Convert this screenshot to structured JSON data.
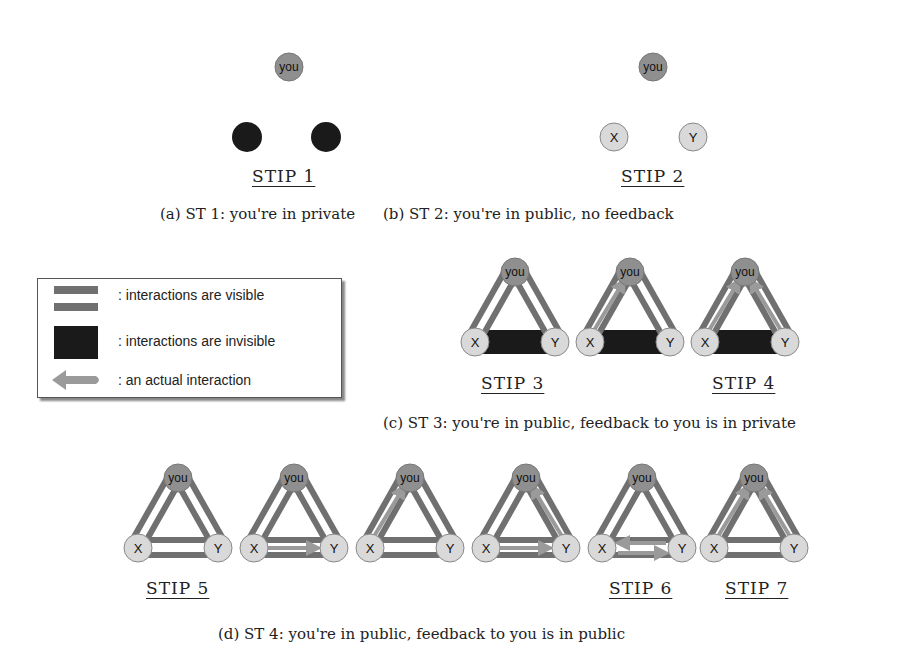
{
  "colors": {
    "visible_edge": "#707070",
    "invisible_edge": "#1a1a1a",
    "interaction_arrow": "#9a9a9a",
    "you_node": "#8f8f8f",
    "xy_node": "#d9d9d9",
    "private_node": "#1a1a1a"
  },
  "nodes": {
    "you": "you",
    "x": "X",
    "y": "Y"
  },
  "panels": {
    "a": {
      "caption": "(a) ST 1: you're in private",
      "stips": [
        "STIP 1"
      ]
    },
    "b": {
      "caption": "(b) ST 2: you're in public, no feedback",
      "stips": [
        "STIP 2"
      ]
    },
    "c": {
      "caption": "(c) ST 3: you're in public, feedback to you is in private",
      "stips": [
        "STIP 3",
        "STIP 4"
      ]
    },
    "d": {
      "caption": "(d) ST 4: you're in public, feedback to you is in public",
      "stips": [
        "STIP 5",
        "STIP 6",
        "STIP 7"
      ]
    }
  },
  "legend": {
    "items": [
      {
        "icon": "double-bar-icon",
        "label": ": interactions are visible"
      },
      {
        "icon": "black-block-icon",
        "label": ": interactions are invisible"
      },
      {
        "icon": "arrow-left-icon",
        "label": ": an actual interaction"
      }
    ]
  }
}
